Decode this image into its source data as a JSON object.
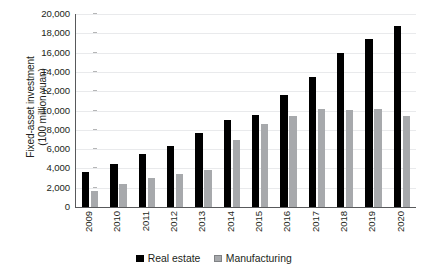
{
  "chart_data": {
    "type": "bar",
    "title": "",
    "subtitle": "",
    "xlabel": "",
    "ylabel": "Fixed-asset investment (100 million yuan)",
    "ylabel_line1": "Fixed-asset investment",
    "ylabel_line2": "(100 million yuan)",
    "ylim": [
      0,
      20000
    ],
    "ytick_step": 2000,
    "grid": true,
    "legend_position": "bottom-center",
    "categories": [
      "2009",
      "2010",
      "2011",
      "2012",
      "2013",
      "2014",
      "2015",
      "2016",
      "2017",
      "2018",
      "2019",
      "2020"
    ],
    "ytick_labels": [
      "20,000",
      "18,000",
      "16,000",
      "14,000",
      "12,000",
      "10,000",
      "8,000",
      "6,000",
      "4,000",
      "2,000",
      "0"
    ],
    "ytick_values": [
      20000,
      18000,
      16000,
      14000,
      12000,
      10000,
      8000,
      6000,
      4000,
      2000,
      0
    ],
    "series": [
      {
        "name": "Real estate",
        "color": "#000000",
        "values": [
          3600,
          4500,
          5500,
          6300,
          7700,
          9000,
          9500,
          11600,
          13500,
          16000,
          17400,
          18800
        ]
      },
      {
        "name": "Manufacturing",
        "color": "#a7a9ac",
        "values": [
          1700,
          2400,
          3000,
          3400,
          3800,
          6900,
          8600,
          9400,
          10200,
          10100,
          10200,
          9400
        ]
      }
    ]
  },
  "colors": {
    "axis": "#58595b",
    "gridline": "#e9eaec",
    "text": "#231f20",
    "real_estate": "#000000",
    "manufacturing": "#a7a9ac",
    "background": "#ffffff"
  }
}
